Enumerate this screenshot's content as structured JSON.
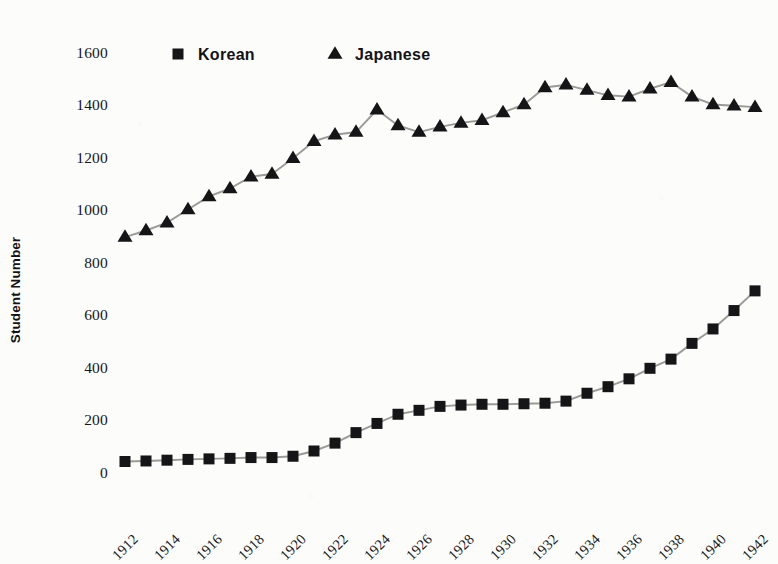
{
  "chart_data": {
    "type": "line",
    "title": "",
    "subtitle": "",
    "xlabel": "",
    "ylabel": "Student Number",
    "x": [
      1912,
      1913,
      1914,
      1915,
      1916,
      1917,
      1918,
      1919,
      1920,
      1921,
      1922,
      1923,
      1924,
      1925,
      1926,
      1927,
      1928,
      1929,
      1930,
      1931,
      1932,
      1933,
      1934,
      1935,
      1936,
      1937,
      1938,
      1939,
      1940,
      1941,
      1942
    ],
    "xlim": [
      1912,
      1942
    ],
    "ylim": [
      0,
      1600
    ],
    "yticks": [
      0,
      200,
      400,
      600,
      800,
      1000,
      1200,
      1400,
      1600
    ],
    "xticks": [
      1912,
      1914,
      1916,
      1918,
      1920,
      1922,
      1924,
      1926,
      1928,
      1930,
      1932,
      1934,
      1936,
      1938,
      1940,
      1942
    ],
    "xtick_labels": [
      "1912",
      "1914",
      "1916",
      "1918",
      "1920",
      "1922",
      "1924",
      "1926",
      "1928",
      "1930",
      "1932",
      "1934",
      "1936",
      "1938",
      "1940",
      "1942"
    ],
    "ytick_labels": [
      "0",
      "200",
      "400",
      "600",
      "800",
      "1000",
      "1200",
      "1400",
      "1600"
    ],
    "xtick_rotation": 45,
    "grid": false,
    "axis_lines": false,
    "legend_position": "top-center",
    "line_color": "#9a9a97",
    "marker_color": "#151518",
    "series": [
      {
        "name": "Korean",
        "marker": "square",
        "values": [
          40,
          42,
          45,
          48,
          50,
          52,
          55,
          55,
          60,
          80,
          110,
          150,
          185,
          220,
          235,
          250,
          255,
          258,
          258,
          260,
          262,
          270,
          300,
          325,
          355,
          395,
          430,
          490,
          545,
          615,
          690
        ]
      },
      {
        "name": "Japanese",
        "marker": "triangle",
        "values": [
          895,
          920,
          950,
          1000,
          1050,
          1080,
          1125,
          1135,
          1195,
          1260,
          1285,
          1295,
          1380,
          1320,
          1295,
          1315,
          1330,
          1340,
          1370,
          1400,
          1465,
          1475,
          1455,
          1435,
          1430,
          1460,
          1485,
          1430,
          1400,
          1395,
          1390
        ]
      }
    ]
  },
  "legend": {
    "items": [
      {
        "label": "Korean",
        "marker": "square"
      },
      {
        "label": "Japanese",
        "marker": "triangle"
      }
    ]
  },
  "axes": {
    "y_title": "Student Number"
  }
}
